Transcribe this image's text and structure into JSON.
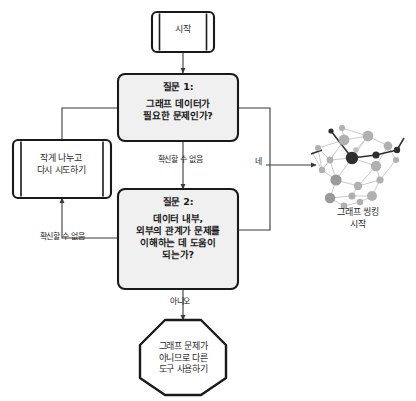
{
  "diagram": {
    "kind": "flowchart",
    "language": "ko",
    "orientation": "top-to-bottom",
    "colors": {
      "node_fill": "#f0f0f0",
      "node_stroke": "#1a1a1a",
      "terminator_fill": "#ffffff",
      "connector": "#3a3a3a",
      "graph_edge": "#c9c9c9",
      "graph_node_light": "#b5b5b5",
      "graph_node_mid": "#8f8f8f",
      "graph_node_dark": "#2e2e2e",
      "background": "#ffffff"
    },
    "nodes": {
      "start": {
        "id": "start",
        "shape": "predefined-process",
        "label": "시작"
      },
      "question1": {
        "id": "question1",
        "shape": "rounded-rectangle",
        "title": "질문 1:",
        "body": "그래프 데이터가\n필요한 문제인가?"
      },
      "question2": {
        "id": "question2",
        "shape": "rounded-rectangle",
        "title": "질문 2:",
        "body": "데이터 내부,\n외부의 관계가 문제를\n이해하는 데 도움이\n되는가?"
      },
      "retry": {
        "id": "retry",
        "shape": "predefined-process",
        "label": "작게 나누고\n다시 시도하기"
      },
      "stop": {
        "id": "stop",
        "shape": "octagon",
        "label": "그래프 문제가\n아니므로 다른\n도구 사용하기"
      },
      "graph_thinking": {
        "id": "graph_thinking",
        "shape": "network-illustration",
        "caption": "그래프 씽킹\n시작"
      }
    },
    "edges": [
      {
        "id": "e-start-q1",
        "from": "start",
        "to": "question1",
        "label": ""
      },
      {
        "id": "e-q1-q2",
        "from": "question1",
        "to": "question2",
        "label": "확신할 수 없음"
      },
      {
        "id": "e-q1-graph",
        "from": "question1",
        "to": "graph_thinking",
        "label": "네"
      },
      {
        "id": "e-q2-retry",
        "from": "question2",
        "to": "retry",
        "label": "확신할 수 없음"
      },
      {
        "id": "e-q2-graph",
        "from": "question2",
        "to": "graph_thinking",
        "label": ""
      },
      {
        "id": "e-q2-stop",
        "from": "question2",
        "to": "stop",
        "label": "아니오"
      },
      {
        "id": "e-retry-q1",
        "from": "retry",
        "to": "question1",
        "label": ""
      }
    ],
    "edge_labels": {
      "unsure_middle": "확신할 수 없음",
      "unsure_left": "확신할 수 없음",
      "yes": "네",
      "no": "아니오"
    }
  }
}
